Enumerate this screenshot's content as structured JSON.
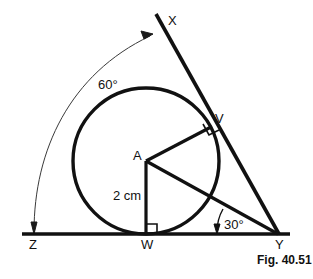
{
  "figure": {
    "caption": "Fig. 40.51",
    "colors": {
      "ink": "#111111",
      "background": "#ffffff",
      "thin_line": "#333333"
    },
    "vertices": {
      "X": {
        "label": "X",
        "x": 156,
        "y": 14
      },
      "V": {
        "label": "V",
        "x": 210,
        "y": 127
      },
      "Y": {
        "label": "Y",
        "x": 278,
        "y": 234
      },
      "W": {
        "label": "W",
        "x": 146,
        "y": 234
      },
      "Z": {
        "label": "Z",
        "x": 28,
        "y": 234
      },
      "A": {
        "label": "A",
        "x": 146,
        "y": 161
      }
    },
    "circle": {
      "center_label": "A",
      "cx": 146,
      "cy": 161,
      "r": 73
    },
    "labels": [
      {
        "name": "point-label-x",
        "text": "X",
        "x": 168,
        "y": 14,
        "kind": "point"
      },
      {
        "name": "point-label-v",
        "text": "V",
        "x": 215,
        "y": 112,
        "kind": "point"
      },
      {
        "name": "point-label-y",
        "text": "Y",
        "x": 275,
        "y": 238,
        "kind": "point"
      },
      {
        "name": "point-label-w",
        "text": "W",
        "x": 141,
        "y": 238,
        "kind": "point"
      },
      {
        "name": "point-label-z",
        "text": "Z",
        "x": 29,
        "y": 238,
        "kind": "point"
      },
      {
        "name": "point-label-a",
        "text": "A",
        "x": 133,
        "y": 149,
        "kind": "point"
      },
      {
        "name": "angle-label-60",
        "text": "60°",
        "x": 98,
        "y": 78,
        "kind": "angle"
      },
      {
        "name": "angle-label-30",
        "text": "30°",
        "x": 224,
        "y": 218,
        "kind": "angle"
      },
      {
        "name": "length-label-radius",
        "text": "2 cm",
        "x": 113,
        "y": 189,
        "kind": "length"
      }
    ],
    "annotations": {
      "angle_at_x_vertex": "60°",
      "angle_at_y_vertex": "30°",
      "radius_length": "2 cm",
      "right_angle_at_v": true,
      "right_angle_at_w": true
    }
  }
}
